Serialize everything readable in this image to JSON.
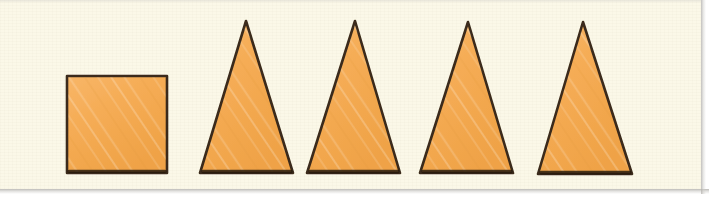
{
  "figure": {
    "kind": "shape-sequence-illustration",
    "background_color": "#fbf8e8",
    "page_edge_color": "#ffffff",
    "scan_edge_color": "#b2b0ac",
    "canvas": {
      "width": 716,
      "height": 206
    },
    "paper": {
      "x": 0,
      "y": 0,
      "width": 701,
      "height": 189
    }
  },
  "style": {
    "fill_color": "#f5ac55",
    "fill_color_light": "#f8bb6e",
    "fill_color_dark": "#efa044",
    "outline_color": "#3b2b1a",
    "outline_width": 2.6,
    "shadow_color": "#2a1d10"
  },
  "shapes": [
    {
      "name": "square",
      "type": "square",
      "index": 1,
      "x": 67,
      "y": 76,
      "width": 100,
      "height": 97,
      "label": "Square"
    },
    {
      "name": "triangle-1",
      "type": "triangle",
      "index": 2,
      "apex_x": 246,
      "apex_y": 21,
      "base_left_x": 200,
      "base_right_x": 293,
      "base_y": 173,
      "label": "Triangle"
    },
    {
      "name": "triangle-2",
      "type": "triangle",
      "index": 3,
      "apex_x": 355,
      "apex_y": 21,
      "base_left_x": 307,
      "base_right_x": 400,
      "base_y": 173,
      "label": "Triangle"
    },
    {
      "name": "triangle-3",
      "type": "triangle",
      "index": 4,
      "apex_x": 468,
      "apex_y": 22,
      "base_left_x": 420,
      "base_right_x": 513,
      "base_y": 173,
      "label": "Triangle"
    },
    {
      "name": "triangle-4",
      "type": "triangle",
      "index": 5,
      "apex_x": 583,
      "apex_y": 22,
      "base_left_x": 538,
      "base_right_x": 632,
      "base_y": 174,
      "label": "Triangle"
    }
  ]
}
